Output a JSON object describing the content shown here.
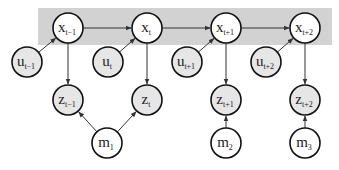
{
  "diagram": {
    "type": "graphical-model",
    "band": {
      "x": 38,
      "y": 8,
      "w": 294,
      "h": 37,
      "color": "#d2d2d2"
    },
    "colors": {
      "observed_fill": "#e6e6e6",
      "latent_fill": "#ffffff",
      "stroke": "#111111",
      "edge": "#333333"
    },
    "nodes": [
      {
        "id": "x_t-1",
        "main": "x",
        "sub": "t−1",
        "cx": 68,
        "cy": 28,
        "observed": false
      },
      {
        "id": "x_t",
        "main": "x",
        "sub": "t",
        "cx": 147,
        "cy": 28,
        "observed": false
      },
      {
        "id": "x_t+1",
        "main": "x",
        "sub": "t+1",
        "cx": 226,
        "cy": 28,
        "observed": false
      },
      {
        "id": "x_t+2",
        "main": "x",
        "sub": "t+2",
        "cx": 305,
        "cy": 28,
        "observed": false
      },
      {
        "id": "u_t-1",
        "main": "u",
        "sub": "t−1",
        "cx": 27,
        "cy": 62,
        "observed": true
      },
      {
        "id": "u_t",
        "main": "u",
        "sub": "t",
        "cx": 108,
        "cy": 62,
        "observed": true
      },
      {
        "id": "u_t+1",
        "main": "u",
        "sub": "t+1",
        "cx": 187,
        "cy": 62,
        "observed": true
      },
      {
        "id": "u_t+2",
        "main": "u",
        "sub": "t+2",
        "cx": 266,
        "cy": 62,
        "observed": true
      },
      {
        "id": "z_t-1",
        "main": "z",
        "sub": "t−1",
        "cx": 68,
        "cy": 100,
        "observed": true
      },
      {
        "id": "z_t",
        "main": "z",
        "sub": "t",
        "cx": 147,
        "cy": 100,
        "observed": true
      },
      {
        "id": "z_t+1",
        "main": "z",
        "sub": "t+1",
        "cx": 226,
        "cy": 100,
        "observed": true
      },
      {
        "id": "z_t+2",
        "main": "z",
        "sub": "t+2",
        "cx": 305,
        "cy": 100,
        "observed": true
      },
      {
        "id": "m_1",
        "main": "m",
        "sub": "1",
        "cx": 107,
        "cy": 143,
        "observed": false
      },
      {
        "id": "m_2",
        "main": "m",
        "sub": "2",
        "cx": 226,
        "cy": 143,
        "observed": false
      },
      {
        "id": "m_3",
        "main": "m",
        "sub": "3",
        "cx": 305,
        "cy": 143,
        "observed": false
      }
    ],
    "edges": [
      {
        "from": "x_t-1",
        "to": "x_t"
      },
      {
        "from": "x_t",
        "to": "x_t+1"
      },
      {
        "from": "x_t+1",
        "to": "x_t+2"
      },
      {
        "from": "u_t-1",
        "to": "x_t-1"
      },
      {
        "from": "u_t",
        "to": "x_t"
      },
      {
        "from": "u_t+1",
        "to": "x_t+1"
      },
      {
        "from": "u_t+2",
        "to": "x_t+2"
      },
      {
        "from": "x_t-1",
        "to": "z_t-1"
      },
      {
        "from": "x_t",
        "to": "z_t"
      },
      {
        "from": "x_t+1",
        "to": "z_t+1"
      },
      {
        "from": "x_t+2",
        "to": "z_t+2"
      },
      {
        "from": "m_1",
        "to": "z_t-1"
      },
      {
        "from": "m_1",
        "to": "z_t"
      },
      {
        "from": "m_2",
        "to": "z_t+1"
      },
      {
        "from": "m_3",
        "to": "z_t+2"
      }
    ],
    "radius": 15
  }
}
